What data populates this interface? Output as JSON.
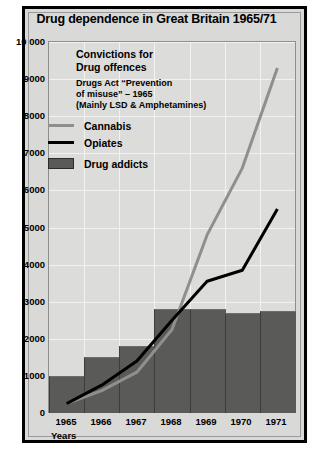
{
  "chart_data": {
    "type": "bar",
    "title": "Drug dependence in Great Britain 1965/71",
    "xlabel": "Years",
    "ylabel": "",
    "categories": [
      "1965",
      "1966",
      "1967",
      "1968",
      "1969",
      "1970",
      "1971"
    ],
    "ylim": [
      0,
      10000
    ],
    "ytick_values": [
      0,
      1000,
      2000,
      3000,
      4000,
      5000,
      6000,
      7000,
      8000,
      9000,
      10000
    ],
    "ytick_labels": [
      "0",
      "1000",
      "2000",
      "3000",
      "4000",
      "5000",
      "6000",
      "7000",
      "8000",
      "9000",
      "10000"
    ],
    "grid": true,
    "legend_position": "inside-top-left",
    "series": [
      {
        "name": "Cannabis",
        "type": "line",
        "color": "#8f8f8d",
        "values": [
          250,
          600,
          1100,
          2250,
          4800,
          6600,
          9300
        ]
      },
      {
        "name": "Opiates",
        "type": "line",
        "color": "#000000",
        "values": [
          250,
          750,
          1400,
          2500,
          3550,
          3850,
          5500
        ]
      },
      {
        "name": "Drug addicts",
        "type": "bar",
        "color": "#5a5a58",
        "values": [
          1000,
          1500,
          1800,
          2800,
          2800,
          2700,
          2750
        ]
      }
    ],
    "annotations": {
      "legend_heading_line1": "Convictions for",
      "legend_heading_line2": "Drug offences",
      "legend_sub_line1": "Drugs Act “Prevention",
      "legend_sub_line2": "of misuse” – 1965",
      "legend_sub_line3": "(Mainly LSD & Amphetamines)"
    }
  },
  "legend": {
    "items": [
      {
        "label": "Cannabis",
        "swatch": "line-swatch-cannabis"
      },
      {
        "label": "Opiates",
        "swatch": "line-swatch-opiates"
      },
      {
        "label": "Drug addicts",
        "swatch": "box-swatch-drug-addicts"
      }
    ]
  }
}
